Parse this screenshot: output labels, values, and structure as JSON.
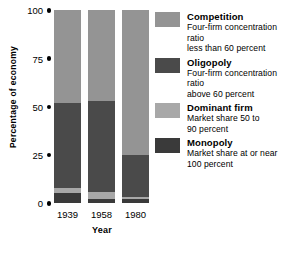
{
  "chart_data": {
    "type": "bar",
    "subtype": "stacked-bar-100-percent",
    "title": "",
    "xlabel": "Year",
    "ylabel": "Percentage of economy",
    "categories": [
      "1939",
      "1958",
      "1980"
    ],
    "ylim": [
      0,
      100
    ],
    "yticks": [
      0,
      25,
      50,
      75,
      100
    ],
    "ytick_labels": [
      "0",
      "25",
      "50",
      "75",
      "100"
    ],
    "grid": false,
    "legend_position": "right",
    "stack_order_bottom_to_top": [
      "Monopoly",
      "Dominant firm",
      "Oligopoly",
      "Competition"
    ],
    "series": [
      {
        "name": "Competition",
        "color": "#949494",
        "values": [
          48,
          47,
          75
        ]
      },
      {
        "name": "Oligopoly",
        "color": "#4a4a4a",
        "values": [
          44,
          47.5,
          22
        ]
      },
      {
        "name": "Dominant firm",
        "color": "#a8a8a8",
        "values": [
          3,
          3.5,
          1
        ]
      },
      {
        "name": "Monopoly",
        "color": "#3a3a3a",
        "values": [
          5,
          2,
          2
        ]
      }
    ]
  },
  "axes": {
    "y_title": "Percentage of economy",
    "x_title": "Year",
    "y_ticks": [
      {
        "label": "100",
        "value": 100
      },
      {
        "label": "75",
        "value": 75
      },
      {
        "label": "50",
        "value": 50
      },
      {
        "label": "25",
        "value": 25
      },
      {
        "label": "0",
        "value": 0
      }
    ],
    "x_ticks": [
      "1939",
      "1958",
      "1980"
    ]
  },
  "legend": {
    "items": [
      {
        "label": "Competition",
        "desc_line1": "Four-firm concentration ratio",
        "desc_line2": "less than 60 percent",
        "color": "#949494"
      },
      {
        "label": "Oligopoly",
        "desc_line1": "Four-firm concentration ratio",
        "desc_line2": "above 60 percent",
        "color": "#4a4a4a"
      },
      {
        "label": "Dominant firm",
        "desc_line1": "Market share 50 to",
        "desc_line2": "90 percent",
        "color": "#a8a8a8"
      },
      {
        "label": "Monopoly",
        "desc_line1": "Market share at or near",
        "desc_line2": "100 percent",
        "color": "#3a3a3a"
      }
    ]
  }
}
